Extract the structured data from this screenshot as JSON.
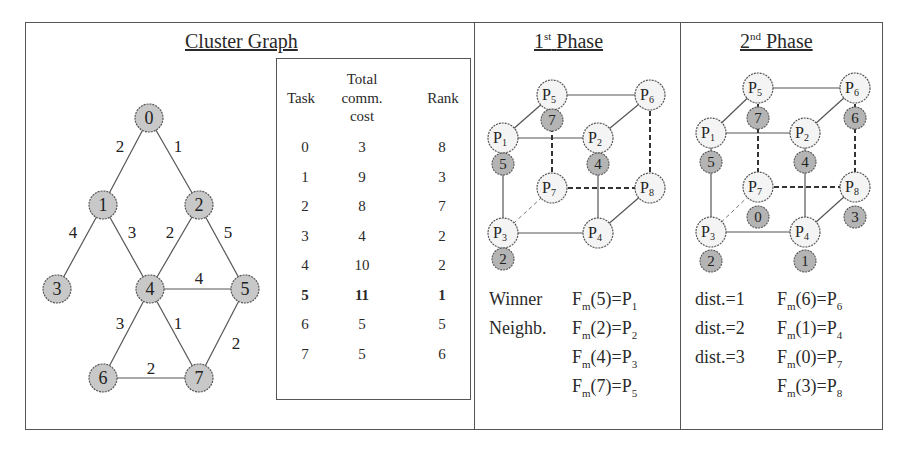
{
  "panels": {
    "cluster_graph": {
      "title": "Cluster Graph",
      "nodes": [
        {
          "id": "0",
          "x": 149,
          "y": 118
        },
        {
          "id": "1",
          "x": 103,
          "y": 205
        },
        {
          "id": "2",
          "x": 199,
          "y": 205
        },
        {
          "id": "3",
          "x": 57,
          "y": 289
        },
        {
          "id": "4",
          "x": 150,
          "y": 289
        },
        {
          "id": "5",
          "x": 245,
          "y": 289
        },
        {
          "id": "6",
          "x": 103,
          "y": 378
        },
        {
          "id": "7",
          "x": 199,
          "y": 378
        }
      ],
      "edges": [
        {
          "from": "0",
          "to": "1",
          "weight": "2",
          "lx": 120,
          "ly": 146
        },
        {
          "from": "0",
          "to": "2",
          "weight": "1",
          "lx": 178,
          "ly": 146
        },
        {
          "from": "1",
          "to": "3",
          "weight": "4",
          "lx": 73,
          "ly": 232
        },
        {
          "from": "1",
          "to": "4",
          "weight": "3",
          "lx": 132,
          "ly": 232
        },
        {
          "from": "2",
          "to": "4",
          "weight": "2",
          "lx": 170,
          "ly": 232
        },
        {
          "from": "2",
          "to": "5",
          "weight": "5",
          "lx": 228,
          "ly": 232
        },
        {
          "from": "4",
          "to": "5",
          "weight": "4",
          "lx": 199,
          "ly": 278
        },
        {
          "from": "4",
          "to": "6",
          "weight": "3",
          "lx": 120,
          "ly": 323
        },
        {
          "from": "4",
          "to": "7",
          "weight": "1",
          "lx": 178,
          "ly": 323
        },
        {
          "from": "5",
          "to": "7",
          "weight": "2",
          "lx": 236,
          "ly": 343
        },
        {
          "from": "6",
          "to": "7",
          "weight": "2",
          "lx": 151,
          "ly": 368
        }
      ]
    },
    "table": {
      "headers": {
        "task": "Task",
        "cost_line1": "Total",
        "cost_line2": "comm.",
        "cost_line3": "cost",
        "rank": "Rank"
      },
      "rows": [
        {
          "task": "0",
          "cost": "3",
          "rank": "8",
          "bold": false
        },
        {
          "task": "1",
          "cost": "9",
          "rank": "3",
          "bold": false
        },
        {
          "task": "2",
          "cost": "8",
          "rank": "7",
          "bold": false
        },
        {
          "task": "3",
          "cost": "4",
          "rank": "2",
          "bold": false
        },
        {
          "task": "4",
          "cost": "10",
          "rank": "2",
          "bold": false
        },
        {
          "task": "5",
          "cost": "11",
          "rank": "1",
          "bold": true
        },
        {
          "task": "6",
          "cost": "5",
          "rank": "5",
          "bold": false
        },
        {
          "task": "7",
          "cost": "5",
          "rank": "6",
          "bold": false
        }
      ]
    },
    "phase1": {
      "title_num": "1",
      "title_sup": "st",
      "title_word": "Phase",
      "processors": [
        {
          "id": "P1",
          "sub": "1",
          "x": 503,
          "y": 138
        },
        {
          "id": "P2",
          "sub": "2",
          "x": 598,
          "y": 138
        },
        {
          "id": "P3",
          "sub": "3",
          "x": 503,
          "y": 233
        },
        {
          "id": "P4",
          "sub": "4",
          "x": 598,
          "y": 233
        },
        {
          "id": "P5",
          "sub": "5",
          "x": 552,
          "y": 95
        },
        {
          "id": "P6",
          "sub": "6",
          "x": 650,
          "y": 95
        },
        {
          "id": "P7",
          "sub": "7",
          "x": 552,
          "y": 188
        },
        {
          "id": "P8",
          "sub": "8",
          "x": 650,
          "y": 188
        }
      ],
      "tasks": [
        {
          "label": "5",
          "x": 503,
          "y": 164
        },
        {
          "label": "7",
          "x": 552,
          "y": 120
        },
        {
          "label": "4",
          "x": 598,
          "y": 164
        },
        {
          "label": "2",
          "x": 503,
          "y": 259
        }
      ],
      "captions": [
        {
          "left": "Winner",
          "task": "5",
          "proc": "1"
        },
        {
          "left": "Neighb.",
          "task": "2",
          "proc": "2"
        },
        {
          "left": "",
          "task": "4",
          "proc": "3"
        },
        {
          "left": "",
          "task": "7",
          "proc": "5"
        }
      ]
    },
    "phase2": {
      "title_num": "2",
      "title_sup": "nd",
      "title_word": "Phase",
      "processors": [
        {
          "id": "P1",
          "sub": "1",
          "x": 711,
          "y": 133
        },
        {
          "id": "P2",
          "sub": "2",
          "x": 805,
          "y": 133
        },
        {
          "id": "P3",
          "sub": "3",
          "x": 711,
          "y": 232
        },
        {
          "id": "P4",
          "sub": "4",
          "x": 805,
          "y": 232
        },
        {
          "id": "P5",
          "sub": "5",
          "x": 758,
          "y": 88
        },
        {
          "id": "P6",
          "sub": "6",
          "x": 855,
          "y": 88
        },
        {
          "id": "P7",
          "sub": "7",
          "x": 758,
          "y": 187
        },
        {
          "id": "P8",
          "sub": "8",
          "x": 855,
          "y": 187
        }
      ],
      "tasks": [
        {
          "label": "5",
          "x": 711,
          "y": 162
        },
        {
          "label": "7",
          "x": 758,
          "y": 118
        },
        {
          "label": "4",
          "x": 805,
          "y": 162
        },
        {
          "label": "2",
          "x": 711,
          "y": 261
        },
        {
          "label": "6",
          "x": 855,
          "y": 118
        },
        {
          "label": "0",
          "x": 758,
          "y": 217
        },
        {
          "label": "3",
          "x": 855,
          "y": 217
        },
        {
          "label": "1",
          "x": 805,
          "y": 261
        }
      ],
      "captions": [
        {
          "left": "dist.=1",
          "task": "6",
          "proc": "6"
        },
        {
          "left": "dist.=2",
          "task": "1",
          "proc": "4"
        },
        {
          "left": "dist.=3",
          "task": "0",
          "proc": "7"
        },
        {
          "left": "",
          "task": "3",
          "proc": "8"
        }
      ]
    }
  },
  "colors": {
    "task_node_fill": "#c8c8c8",
    "proc_node_fill": "#f4f4f4",
    "stroke": "#555555"
  }
}
